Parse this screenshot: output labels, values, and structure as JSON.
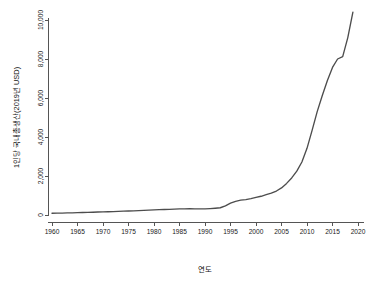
{
  "chart_data": {
    "type": "line",
    "title": "",
    "xlabel": "연도",
    "ylabel": "1인당 국내총생산(2019년 USD)",
    "xlim": [
      1960,
      2020
    ],
    "ylim": [
      0,
      10400
    ],
    "grid": false,
    "legend": null,
    "x_ticks": [
      1960,
      1965,
      1970,
      1975,
      1980,
      1985,
      1990,
      1995,
      2000,
      2005,
      2010,
      2015,
      2020
    ],
    "x_tick_labels": [
      "1960",
      "1965",
      "1970",
      "1975",
      "1980",
      "1985",
      "1990",
      "1995",
      "2000",
      "2005",
      "2010",
      "2015",
      "2020"
    ],
    "y_ticks": [
      0,
      2000,
      4000,
      6000,
      8000,
      10000
    ],
    "y_tick_labels": [
      "0",
      "2,000",
      "4,000",
      "6,000",
      "8,000",
      "10,000"
    ],
    "line_color": "#4d4d4d",
    "axis_color": "#555555",
    "series": [
      {
        "name": "1인당 국내총생산(2019년 USD)",
        "x": [
          1960,
          1961,
          1962,
          1963,
          1964,
          1965,
          1966,
          1967,
          1968,
          1969,
          1970,
          1971,
          1972,
          1973,
          1974,
          1975,
          1976,
          1977,
          1978,
          1979,
          1980,
          1981,
          1982,
          1983,
          1984,
          1985,
          1986,
          1987,
          1988,
          1989,
          1990,
          1991,
          1992,
          1993,
          1994,
          1995,
          1996,
          1997,
          1998,
          1999,
          2000,
          2001,
          2002,
          2003,
          2004,
          2005,
          2006,
          2007,
          2008,
          2009,
          2010,
          2011,
          2012,
          2013,
          2014,
          2015,
          2016,
          2017,
          2018,
          2019
        ],
        "values": [
          90,
          95,
          98,
          105,
          112,
          118,
          126,
          134,
          142,
          152,
          160,
          168,
          176,
          188,
          196,
          204,
          215,
          228,
          240,
          250,
          262,
          272,
          282,
          292,
          300,
          312,
          318,
          322,
          318,
          316,
          318,
          330,
          348,
          372,
          470,
          610,
          700,
          760,
          790,
          840,
          900,
          960,
          1040,
          1120,
          1230,
          1390,
          1620,
          1900,
          2250,
          2720,
          3420,
          4340,
          5300,
          6130,
          6900,
          7570,
          8000,
          8120,
          9100,
          10400
        ]
      }
    ],
    "annotations": [
      "1960-1992 구간은 거의 평탄하며 1,000 USD 미만",
      "1993-1995 구간에서 기울기가 급격히 증가",
      "2005년 이후 기하급수적 상승",
      "2015-2016 구간에 짧은 정체 구간",
      "2019년 최고값 약 10,400 USD"
    ]
  }
}
